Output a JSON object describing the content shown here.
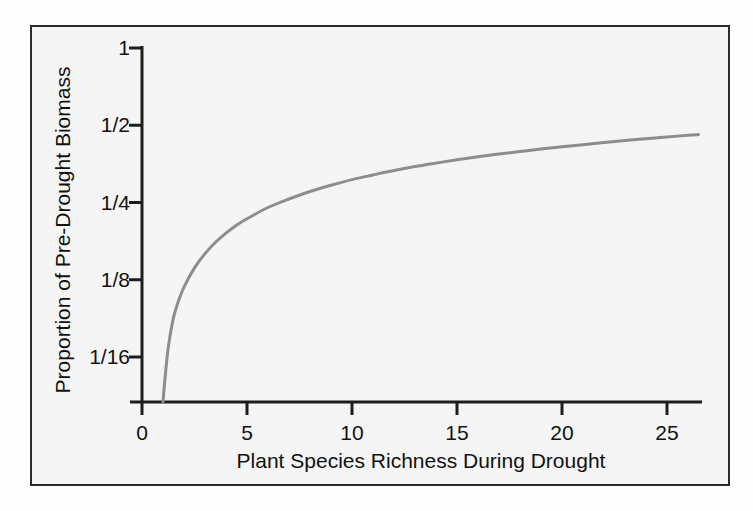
{
  "figure": {
    "frame_color": "#2a2a2a",
    "plot_background": "#f5f5f5",
    "page_background": "#fefefe"
  },
  "chart_data": {
    "type": "line",
    "title": "",
    "subtitle": "",
    "xlabel": "Plant Species Richness During Drought",
    "ylabel": "Proportion of Pre-Drought Biomass",
    "xlim": [
      -0.6,
      26.6
    ],
    "ylim_log2": [
      -4.6,
      0
    ],
    "yscale": "log2",
    "grid": false,
    "legend": null,
    "line_color": "#8d8d8d",
    "line_width": 3,
    "xticks": [
      0,
      5,
      10,
      15,
      20,
      25
    ],
    "xticklabels": [
      "0",
      "5",
      "10",
      "15",
      "20",
      "25"
    ],
    "yticks": [
      1,
      0.5,
      0.25,
      0.125,
      0.0625
    ],
    "yticklabels": [
      "1",
      "1/2",
      "1/4",
      "1/8",
      "1/16"
    ],
    "x": [
      1.0,
      1.1,
      1.25,
      1.5,
      1.75,
      2.0,
      2.5,
      3.0,
      3.5,
      4.0,
      4.5,
      5.0,
      6.0,
      7.0,
      8.0,
      9.0,
      10.0,
      11.0,
      12.0,
      13.0,
      14.0,
      15.0,
      16.0,
      17.0,
      18.0,
      19.0,
      20.0,
      21.0,
      22.0,
      23.0,
      24.0,
      25.0,
      26.0,
      26.5
    ],
    "values": [
      0.039,
      0.052,
      0.068,
      0.089,
      0.104,
      0.117,
      0.139,
      0.158,
      0.175,
      0.19,
      0.204,
      0.216,
      0.239,
      0.258,
      0.276,
      0.292,
      0.307,
      0.32,
      0.333,
      0.345,
      0.356,
      0.367,
      0.377,
      0.386,
      0.395,
      0.404,
      0.412,
      0.42,
      0.428,
      0.436,
      0.443,
      0.45,
      0.457,
      0.46
    ],
    "annotations": []
  },
  "axes": {
    "x_title": "Plant Species Richness During Drought",
    "y_title": "Proportion of Pre-Drought Biomass",
    "x_ticks": [
      {
        "label": "0",
        "value": 0
      },
      {
        "label": "5",
        "value": 5
      },
      {
        "label": "10",
        "value": 10
      },
      {
        "label": "15",
        "value": 15
      },
      {
        "label": "20",
        "value": 20
      },
      {
        "label": "25",
        "value": 25
      }
    ],
    "y_ticks": [
      {
        "label": "1",
        "value": 1
      },
      {
        "label": "1/2",
        "value": 0.5
      },
      {
        "label": "1/4",
        "value": 0.25
      },
      {
        "label": "1/8",
        "value": 0.125
      },
      {
        "label": "1/16",
        "value": 0.0625
      }
    ]
  }
}
